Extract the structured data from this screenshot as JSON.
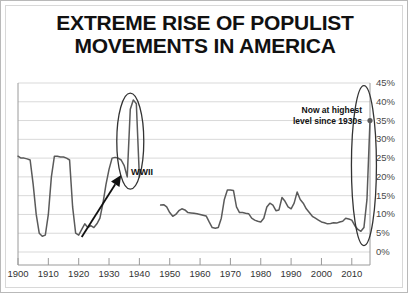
{
  "title": {
    "line1": "EXTREME RISE OF POPULIST",
    "line2": "MOVEMENTS IN AMERICA"
  },
  "annotations": {
    "now": {
      "line1": "Now at highest",
      "line2": "level since 1930s"
    },
    "wwii": "WWII"
  },
  "colors": {
    "line": "#5a5a5a",
    "grid": "#d9d9d9",
    "axis": "#9a9a9a",
    "text": "#111111",
    "ellipse": "#333333",
    "arrow": "#111111",
    "background": "#ffffff"
  },
  "chart_data": {
    "type": "line",
    "title": "EXTREME RISE OF POPULIST MOVEMENTS IN AMERICA",
    "xlabel": "",
    "ylabel": "",
    "xlim": [
      1900,
      2016
    ],
    "ylim": [
      0,
      45
    ],
    "ytick_labels": [
      "0%",
      "5%",
      "10%",
      "15%",
      "20%",
      "25%",
      "30%",
      "35%",
      "40%",
      "45%"
    ],
    "ytick_values": [
      0,
      5,
      10,
      15,
      20,
      25,
      30,
      35,
      40,
      45
    ],
    "xtick_labels": [
      "1900",
      "1910",
      "1920",
      "1930",
      "1940",
      "1950",
      "1960",
      "1970",
      "1980",
      "1990",
      "2000",
      "2010"
    ],
    "xtick_values": [
      1900,
      1910,
      1920,
      1930,
      1940,
      1950,
      1960,
      1970,
      1980,
      1990,
      2000,
      2010
    ],
    "grid": true,
    "legend": "none",
    "y_axis_position": "right",
    "series": [
      {
        "name": "Populist movement share (early era)",
        "gap_after": 1940,
        "x": [
          1900,
          1901,
          1902,
          1903,
          1904,
          1905,
          1906,
          1907,
          1908,
          1909,
          1910,
          1911,
          1912,
          1913,
          1914,
          1915,
          1916,
          1917,
          1918,
          1919,
          1920,
          1921,
          1922,
          1923,
          1924,
          1925,
          1926,
          1927,
          1928,
          1929,
          1930,
          1931,
          1932,
          1933,
          1934,
          1935,
          1936,
          1937,
          1938,
          1939,
          1940
        ],
        "values": [
          25.5,
          25.0,
          25.0,
          24.8,
          24.5,
          18.0,
          10.0,
          5.0,
          4.2,
          4.5,
          10.0,
          20.0,
          25.5,
          25.5,
          25.3,
          25.3,
          25.0,
          24.5,
          12.0,
          5.0,
          4.5,
          6.0,
          7.5,
          6.5,
          7.0,
          6.5,
          7.5,
          9.0,
          13.0,
          18.0,
          22.0,
          25.0,
          25.2,
          25.0,
          24.5,
          23.0,
          20.0,
          38.0,
          40.5,
          39.5,
          20.0
        ]
      },
      {
        "name": "Populist movement share (modern era)",
        "gap_before": 1947,
        "x": [
          1947,
          1948,
          1949,
          1950,
          1951,
          1952,
          1953,
          1954,
          1955,
          1956,
          1957,
          1958,
          1959,
          1960,
          1961,
          1962,
          1963,
          1964,
          1965,
          1966,
          1967,
          1968,
          1969,
          1970,
          1971,
          1972,
          1973,
          1974,
          1975,
          1976,
          1977,
          1978,
          1979,
          1980,
          1981,
          1982,
          1983,
          1984,
          1985,
          1986,
          1987,
          1988,
          1989,
          1990,
          1991,
          1992,
          1993,
          1994,
          1995,
          1996,
          1997,
          1998,
          1999,
          2000,
          2001,
          2002,
          2003,
          2004,
          2005,
          2006,
          2007,
          2008,
          2009,
          2010,
          2011,
          2012,
          2013,
          2014,
          2015,
          2016
        ],
        "values": [
          12.5,
          12.6,
          12.0,
          10.5,
          9.5,
          10.0,
          11.0,
          11.5,
          11.2,
          10.5,
          10.4,
          10.3,
          10.2,
          10.0,
          9.8,
          9.6,
          8.0,
          6.5,
          6.3,
          6.5,
          9.0,
          14.0,
          16.5,
          16.5,
          16.4,
          12.0,
          10.5,
          10.5,
          10.3,
          10.2,
          9.0,
          8.5,
          8.2,
          8.0,
          9.0,
          12.0,
          13.0,
          12.5,
          11.0,
          11.2,
          14.5,
          13.5,
          12.0,
          11.5,
          13.0,
          16.0,
          14.0,
          13.0,
          11.5,
          10.5,
          9.5,
          9.0,
          8.5,
          8.0,
          7.8,
          7.5,
          7.6,
          7.8,
          7.7,
          8.0,
          8.2,
          9.0,
          8.8,
          8.5,
          7.0,
          6.0,
          5.5,
          6.5,
          14.0,
          35.0
        ]
      }
    ],
    "markers": [
      {
        "x": 2016,
        "y": 35.0,
        "label": "latest-point"
      }
    ],
    "highlights": [
      {
        "type": "ellipse",
        "center_x": 1937,
        "center_y": 29.5,
        "label": "1930s-peak-circle"
      },
      {
        "type": "ellipse",
        "center_x": 2014,
        "center_y": 23.0,
        "label": "current-peak-circle"
      }
    ],
    "arrow": {
      "from_x": 1921,
      "from_y": 4.0,
      "to_x": 1934,
      "to_y": 20.5,
      "label": "WWII"
    }
  }
}
